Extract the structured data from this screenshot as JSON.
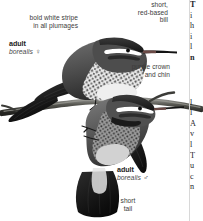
{
  "plate": {
    "kind": "field-guide-illustration-plate",
    "subject": "perched hummingbirds",
    "palette": {
      "ink": "#1c1c1c",
      "label_text": "#3b3b3b",
      "page": "#ffffff",
      "plumage_dark": "#2e2e2e",
      "plumage_mid": "#6e6e6e",
      "plumage_light": "#cfcfcf",
      "branch": "#4a4a48"
    }
  },
  "annotations": {
    "white_stripe": {
      "text": "bold white stripe\nin all plumages",
      "align": "right"
    },
    "bill": {
      "text": "short,\nred-based\nbill",
      "align": "right"
    },
    "crown": {
      "text": "purple crown\nand chin",
      "align": "right"
    },
    "tail": {
      "text": "short\ntail",
      "align": "center"
    }
  },
  "figures": {
    "female": {
      "age": "adult",
      "subspecies": "borealis",
      "sex_symbol": "♀",
      "sex_name": "female"
    },
    "male": {
      "age": "adult",
      "subspecies": "borealis",
      "sex_symbol": "♂",
      "sex_name": "male"
    }
  },
  "text_column": {
    "note": "body text column clipped at right page edge",
    "lines": [
      "T",
      "i",
      "h",
      "i",
      "l",
      "n",
      "",
      "l",
      "l",
      "A",
      "v",
      "l",
      "T",
      "u",
      "c",
      "n"
    ]
  }
}
